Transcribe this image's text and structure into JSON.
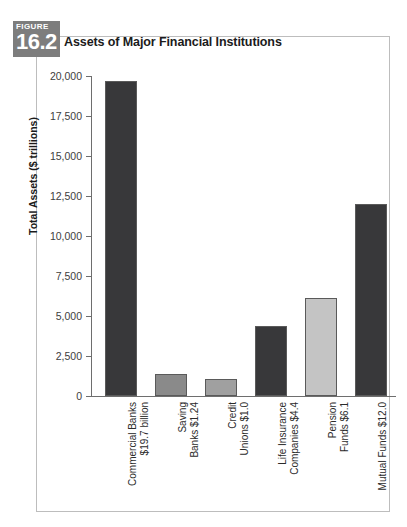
{
  "figure": {
    "badge_word": "FIGURE",
    "badge_number": "16.2",
    "title": "Assets of Major Financial Institutions"
  },
  "colors": {
    "badge_bg": "#7d7d7d",
    "frame_border": "#bdbdbd",
    "axis": "#6e6e6e",
    "bar_dark": "#38383a",
    "bar_medium": "#8a8a8a",
    "bar_light_medium": "#a0a0a0",
    "bar_light": "#c4c4c4"
  },
  "chart_data": {
    "type": "bar",
    "title": "Assets of Major Financial Institutions",
    "xlabel": "",
    "ylabel": "Total Assets ($ trillions)",
    "ylim": [
      0,
      20000
    ],
    "ytick_labels": [
      "20,000",
      "17,500",
      "15,000",
      "12,500",
      "10,000",
      "7,500",
      "5,000",
      "2,500",
      "0"
    ],
    "yticks": [
      20000,
      17500,
      15000,
      12500,
      10000,
      7500,
      5000,
      2500,
      0
    ],
    "grid": false,
    "legend": "none",
    "categories": [
      "Commercial Banks\n$19.7 billion",
      "Saving\nBanks $1.24",
      "Credit\nUnions $1.0",
      "Life Insurance\nCompanies $4.4",
      "Pension\nFunds $6.1",
      "Mutual Funds $12.0"
    ],
    "values": [
      19700,
      1350,
      1050,
      4400,
      6100,
      12000
    ],
    "bar_colors": [
      "#38383a",
      "#8a8a8a",
      "#a0a0a0",
      "#38383a",
      "#c4c4c4",
      "#38383a"
    ],
    "annotations": [
      {
        "category": "Commercial Banks",
        "value_text": "$19.7 billion"
      },
      {
        "category": "Saving Banks",
        "value_text": "$1.24"
      },
      {
        "category": "Credit Unions",
        "value_text": "$1.0"
      },
      {
        "category": "Life Insurance Companies",
        "value_text": "$4.4"
      },
      {
        "category": "Pension Funds",
        "value_text": "$6.1"
      },
      {
        "category": "Mutual Funds",
        "value_text": "$12.0"
      }
    ]
  }
}
